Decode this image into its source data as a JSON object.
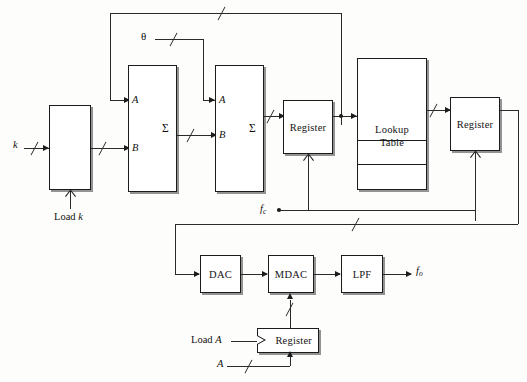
{
  "diagram": {
    "background": "#fdfdfc",
    "line_color": "#2a2a2a",
    "blocks": {
      "k_register": {
        "label": ""
      },
      "adder1": {
        "label": "Σ",
        "input_a": "A",
        "input_b": "B"
      },
      "adder2": {
        "label": "Σ",
        "input_a": "A",
        "input_b": "B"
      },
      "phase_register": {
        "label": "Register"
      },
      "lookup_table": {
        "label": "Lookup\nTable",
        "line1": "Lookup",
        "line2": "Table"
      },
      "amplitude_register": {
        "label": "Register"
      },
      "dac": {
        "label": "DAC"
      },
      "mdac": {
        "label": "MDAC"
      },
      "lpf": {
        "label": "LPF"
      },
      "a_register": {
        "label": "Register"
      }
    },
    "signals": {
      "k_input": "k",
      "load_k": "Load k",
      "load_k_word": "Load",
      "load_k_var": "k",
      "theta": "θ",
      "fc": "f",
      "fc_sub": "c",
      "fo": "f",
      "fo_sub": "o",
      "load_a_word": "Load",
      "load_a_var": "A",
      "a_input": "A"
    }
  }
}
